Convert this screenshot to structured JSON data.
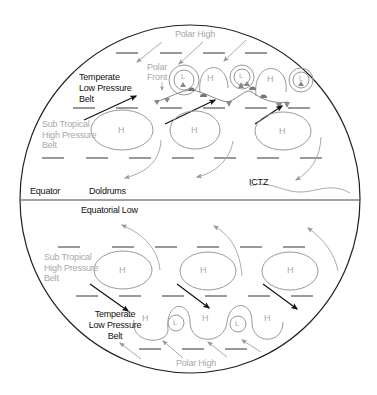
{
  "diagram": {
    "colors": {
      "outline": "#222222",
      "grey": "#a8a8a8",
      "black_arrow": "#111111",
      "front_marker": "#8a8a8a"
    },
    "northern_hemisphere": {
      "polar_high": "Polar High",
      "polar_front": "Polar Front",
      "temperate_belt": "Temperate\nLow Pressure\nBelt",
      "subtropical_belt": "Sub Tropical\nHigh Pressure\nBelt",
      "front_cells": [
        {
          "type": "L"
        },
        {
          "type": "H"
        },
        {
          "type": "L"
        },
        {
          "type": "H"
        },
        {
          "type": "L"
        }
      ],
      "subtropical_cells": [
        {
          "type": "H"
        },
        {
          "type": "H"
        },
        {
          "type": "H"
        }
      ]
    },
    "equator": {
      "equator_label": "Equator",
      "doldrums_label": "Doldrums",
      "ictz_label": "ICTZ",
      "equatorial_low": "Equatorial Low"
    },
    "southern_hemisphere": {
      "subtropical_belt": "Sub Tropical\nHigh Pressure\nBelt",
      "temperate_belt": "Temperate\nLow Pressure\nBelt",
      "polar_high": "Polar High",
      "subtropical_cells": [
        {
          "type": "H"
        },
        {
          "type": "H"
        },
        {
          "type": "H"
        }
      ],
      "wave_cells": [
        {
          "type": "H"
        },
        {
          "type": "L"
        },
        {
          "type": "H"
        },
        {
          "type": "L"
        },
        {
          "type": "H"
        }
      ]
    }
  }
}
